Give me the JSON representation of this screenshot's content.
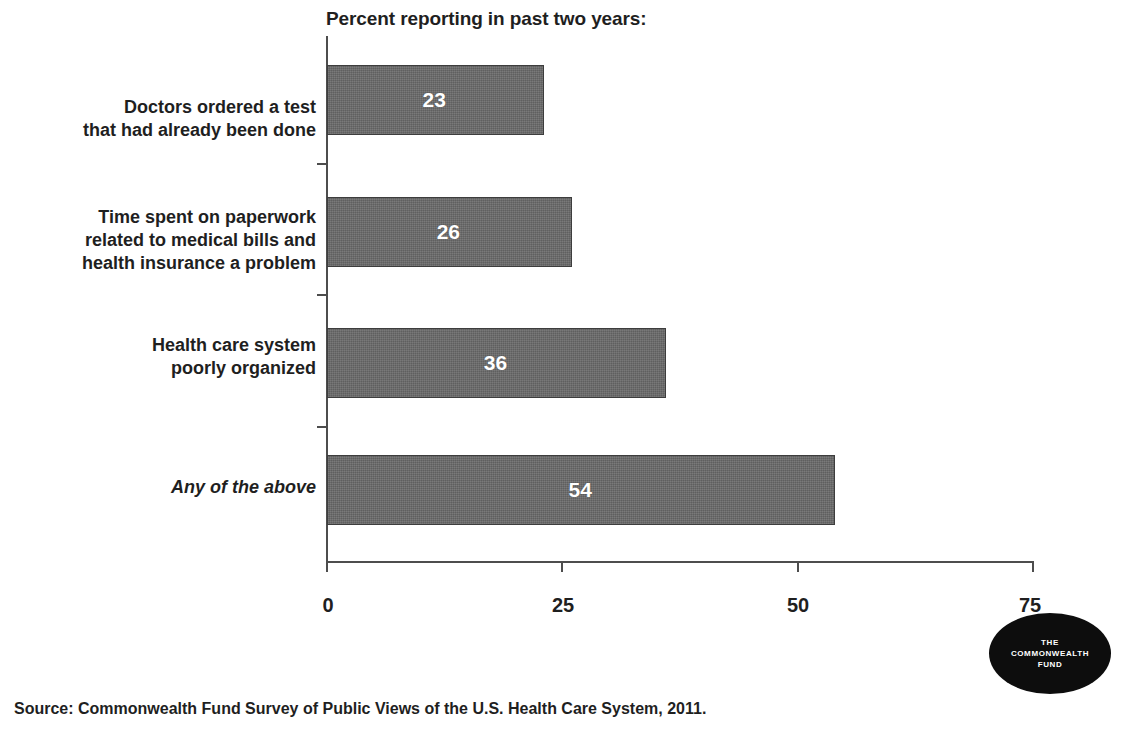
{
  "chart_data": {
    "type": "bar",
    "orientation": "horizontal",
    "title": "Percent reporting in past two years:",
    "xlabel": "",
    "ylabel": "",
    "xlim": [
      0,
      75
    ],
    "xticks": [
      "0",
      "25",
      "50",
      "75"
    ],
    "grid": false,
    "legend": null,
    "bar_color": "#6a6a6a",
    "bar_border_color": "#3d3d3d",
    "value_label_color": "#ffffff",
    "categories": [
      "Doctors ordered a test that had already been done",
      "Time spent on paperwork related to medical bills and health insurance a problem",
      "Health care system poorly organized",
      "Any of the above"
    ],
    "values": [
      23,
      26,
      36,
      54
    ],
    "bars": [
      {
        "value": 23,
        "value_label": "23",
        "label_lines": [
          "Doctors ordered a test",
          "that had already been done"
        ],
        "italic": false
      },
      {
        "value": 26,
        "value_label": "26",
        "label_lines": [
          "Time spent on paperwork",
          "related to medical bills and",
          "health insurance a problem"
        ],
        "italic": false
      },
      {
        "value": 36,
        "value_label": "36",
        "label_lines": [
          "Health care system",
          "poorly organized"
        ],
        "italic": false
      },
      {
        "value": 54,
        "value_label": "54",
        "label_lines": [
          "Any of the above"
        ],
        "italic": true
      }
    ]
  },
  "source": {
    "text": "Source: Commonwealth Fund Survey of Public Views of the U.S. Health Care System, 2011."
  },
  "logo": {
    "lines": [
      "THE",
      "COMMONWEALTH",
      "FUND"
    ]
  }
}
